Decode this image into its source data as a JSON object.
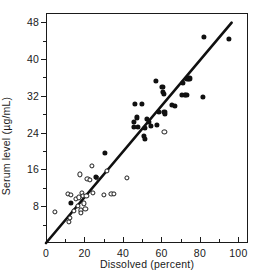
{
  "chart_data": {
    "type": "scatter",
    "title": "",
    "xlabel": "Dissolved (percent)",
    "ylabel": "Serum level (µg/mL)",
    "xlim": [
      0,
      105
    ],
    "ylim": [
      0,
      50
    ],
    "xticks": [
      0,
      20,
      40,
      60,
      80,
      100
    ],
    "xtick_labels": [
      "0",
      "20",
      "40",
      "60",
      "80",
      "100"
    ],
    "xticks_minor": [
      10,
      30,
      50,
      70,
      90
    ],
    "yticks": [
      8,
      16,
      24,
      32,
      40,
      48
    ],
    "ytick_labels": [
      "8",
      "16",
      "24",
      "32",
      "40",
      "48"
    ],
    "yticks_minor": [
      4,
      12,
      20,
      28,
      36,
      44
    ],
    "grid": false,
    "legend": null,
    "series": [
      {
        "name": "open-circles",
        "marker": "open-circle",
        "color": "#1a1a1a",
        "points": [
          [
            4.5,
            6.8
          ],
          [
            11.5,
            10.6
          ],
          [
            12.0,
            4.6
          ],
          [
            12.3,
            5.4
          ],
          [
            13.0,
            10.5
          ],
          [
            14.5,
            7.0
          ],
          [
            15.5,
            9.6
          ],
          [
            16.5,
            8.0
          ],
          [
            17.0,
            9.9
          ],
          [
            17.5,
            14.9
          ],
          [
            18.0,
            7.1
          ],
          [
            18.3,
            6.6
          ],
          [
            18.6,
            10.9
          ],
          [
            19.2,
            10.3
          ],
          [
            19.6,
            8.6
          ],
          [
            20.5,
            7.5
          ],
          [
            21.0,
            10.2
          ],
          [
            21.5,
            13.9
          ],
          [
            23.0,
            13.8
          ],
          [
            23.8,
            16.8
          ],
          [
            24.5,
            10.9
          ],
          [
            26.3,
            14.2
          ],
          [
            30.0,
            10.5
          ],
          [
            31.5,
            15.6
          ],
          [
            34.0,
            10.6
          ],
          [
            35.3,
            10.7
          ],
          [
            42.0,
            14.2
          ],
          [
            61.5,
            24.1
          ]
        ]
      },
      {
        "name": "filled-circles",
        "marker": "filled-circle",
        "color": "#101010",
        "points": [
          [
            13.0,
            8.7
          ],
          [
            25.8,
            14.3
          ],
          [
            30.8,
            19.6
          ],
          [
            45.5,
            26.4
          ],
          [
            45.8,
            25.2
          ],
          [
            46.3,
            30.3
          ],
          [
            47.3,
            27.3
          ],
          [
            47.6,
            25.2
          ],
          [
            49.8,
            30.2
          ],
          [
            51.0,
            23.2
          ],
          [
            51.3,
            22.7
          ],
          [
            51.6,
            25.0
          ],
          [
            52.3,
            27.0
          ],
          [
            53.5,
            26.3
          ],
          [
            54.5,
            25.5
          ],
          [
            57.0,
            35.3
          ],
          [
            57.5,
            25.6
          ],
          [
            58.5,
            28.5
          ],
          [
            60.5,
            33.9
          ],
          [
            60.8,
            32.8
          ],
          [
            61.2,
            32.5
          ],
          [
            61.5,
            28.5
          ],
          [
            62.0,
            28.0
          ],
          [
            65.5,
            30.0
          ],
          [
            67.0,
            29.8
          ],
          [
            70.5,
            32.2
          ],
          [
            71.3,
            34.8
          ],
          [
            72.0,
            32.2
          ],
          [
            73.0,
            32.2
          ],
          [
            73.5,
            35.6
          ],
          [
            74.5,
            35.8
          ],
          [
            81.5,
            31.7
          ],
          [
            82.0,
            44.8
          ],
          [
            95.0,
            44.3
          ]
        ]
      }
    ],
    "trend_line": {
      "name": "regression-line",
      "type": "line",
      "color": "#101010",
      "from": [
        0,
        0
      ],
      "to": [
        96.5,
        47.9
      ]
    }
  }
}
